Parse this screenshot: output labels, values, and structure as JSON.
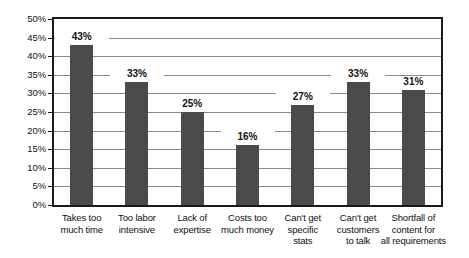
{
  "chart_data": {
    "type": "bar",
    "title": "",
    "subtitle": "",
    "xlabel": "",
    "ylabel": "",
    "categories": [
      "Takes too much time",
      "Too labor intensive",
      "Lack of expertise",
      "Costs too much money",
      "Can't get specific stats",
      "Can't get customers to talk",
      "Shortfall of content for all requirements"
    ],
    "category_lines": [
      [
        "Takes too",
        "much time"
      ],
      [
        "Too labor",
        "intensive"
      ],
      [
        "Lack of",
        "expertise"
      ],
      [
        "Costs too",
        "much money"
      ],
      [
        "Can't get",
        "specific",
        "stats"
      ],
      [
        "Can't get",
        "customers",
        "to talk"
      ],
      [
        "Shortfall of",
        "content for",
        "all requirements"
      ]
    ],
    "values": [
      43,
      33,
      25,
      16,
      27,
      33,
      31
    ],
    "value_labels": [
      "43%",
      "33%",
      "25%",
      "16%",
      "27%",
      "33%",
      "31%"
    ],
    "ylim": [
      0,
      50
    ],
    "ytick_values": [
      0,
      5,
      10,
      15,
      20,
      25,
      30,
      35,
      40,
      45,
      50
    ],
    "ytick_labels": [
      "0%",
      "5%",
      "10%",
      "15%",
      "20%",
      "25%",
      "30%",
      "35%",
      "40%",
      "45%",
      "50%"
    ],
    "grid": true,
    "grid_axis": "y",
    "legend": false,
    "legend_entries": [],
    "bar_color": "#4a4a4a",
    "grid_color": "#8a8a8a",
    "axis_color": "#1a1a1a",
    "background_color": "#ffffff"
  }
}
